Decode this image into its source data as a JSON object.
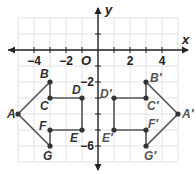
{
  "chart_data": {
    "type": "scatter",
    "title": "",
    "xlabel": "x",
    "ylabel": "y",
    "origin_label": "O",
    "xlim": [
      -5,
      5
    ],
    "ylim": [
      -7,
      2
    ],
    "grid": true,
    "x_ticks": [
      -4,
      -3,
      -2,
      -1,
      1,
      2,
      3,
      4
    ],
    "x_tick_labels": [
      {
        "value": -4,
        "text": "−4"
      },
      {
        "value": -2,
        "text": "−2"
      },
      {
        "value": 2,
        "text": "2"
      },
      {
        "value": 4,
        "text": "4"
      }
    ],
    "y_ticks": [
      1,
      -1,
      -2,
      -3,
      -4,
      -5,
      -6
    ],
    "y_tick_labels": [
      {
        "value": -2,
        "text": "−2"
      },
      {
        "value": -6,
        "text": "−6"
      }
    ],
    "figures": [
      {
        "name": "ABCDEFG",
        "color": "#555555",
        "points": [
          {
            "label": "A",
            "x": -5,
            "y": -4
          },
          {
            "label": "B",
            "x": -3,
            "y": -2
          },
          {
            "label": "C",
            "x": -3,
            "y": -3
          },
          {
            "label": "D",
            "x": -1,
            "y": -3
          },
          {
            "label": "E",
            "x": -1,
            "y": -5
          },
          {
            "label": "F",
            "x": -3,
            "y": -5
          },
          {
            "label": "G",
            "x": -3,
            "y": -6
          }
        ]
      },
      {
        "name": "A'B'C'D'E'F'G'",
        "color": "#555555",
        "points": [
          {
            "label": "A′",
            "x": 5,
            "y": -4
          },
          {
            "label": "B′",
            "x": 3,
            "y": -2
          },
          {
            "label": "C′",
            "x": 3,
            "y": -3
          },
          {
            "label": "D′",
            "x": 1,
            "y": -3
          },
          {
            "label": "E′",
            "x": 1,
            "y": -5
          },
          {
            "label": "F′",
            "x": 3,
            "y": -5
          },
          {
            "label": "G′",
            "x": 3,
            "y": -6
          }
        ]
      }
    ]
  }
}
